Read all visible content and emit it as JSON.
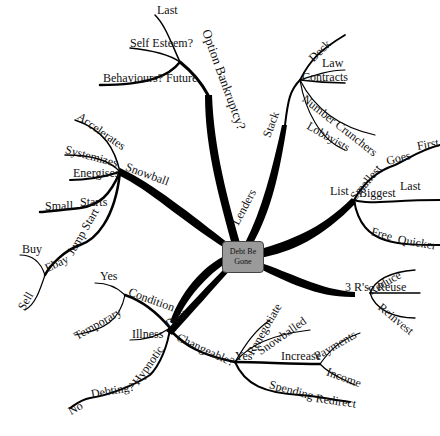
{
  "mindmap": {
    "center": {
      "line1": "Debt Be",
      "line2": "Gone"
    },
    "branches": {
      "option": {
        "label": "Option Bankruptcy?",
        "children": [
          "Last",
          "Self Esteem?",
          "Behaviours? Future"
        ]
      },
      "lenders": {
        "label": "Lenders",
        "stack": "Stack",
        "children": [
          "Deck",
          "Law",
          "Contracts",
          "Number Crunchers",
          "Lobbyists"
        ]
      },
      "snowball": {
        "label": "Snowball",
        "children": [
          "Accelerates",
          "Systemizes",
          "Energises",
          "Starts",
          "Small",
          "Jump Start",
          "Ebay",
          "Buy",
          "Sell"
        ]
      },
      "list": {
        "label": "List",
        "smallest": "Smallest",
        "goes": "Goes",
        "first": "First",
        "biggest": "Biggest",
        "last": "Last",
        "free": "Free",
        "quicker": "Quicker"
      },
      "threers": {
        "label": "3 R's",
        "children": [
          "Reduce",
          "Reuse",
          "Reinvest"
        ]
      },
      "debt": {
        "label": "Debt",
        "condition": "Condition",
        "yes": "Yes",
        "temporary": "Temporary",
        "illness": "Illness",
        "hypnotic": "Hypnotic",
        "debting": "Debting?",
        "no": "No"
      },
      "changeable": {
        "label": "Changeable?",
        "yes": "Yes",
        "renegotiate": "Renegotiate",
        "snowballed": "Snowballed",
        "increase": "Increase",
        "payments": "Payments",
        "income": "Income",
        "spending": "Spending",
        "redirect": "Redirect"
      }
    },
    "colors": {
      "line": "#000000",
      "center_fill": "#9a9a9a",
      "background": "#ffffff"
    }
  }
}
